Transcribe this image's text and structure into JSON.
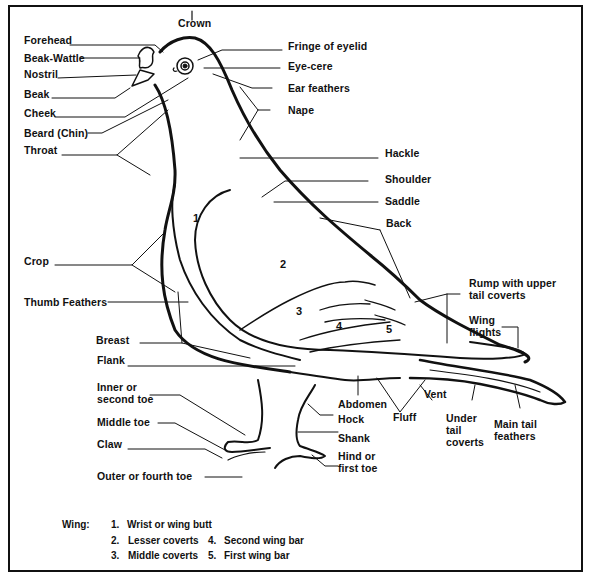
{
  "diagram": {
    "type": "anatomy",
    "labels_left": [
      {
        "id": "forehead",
        "text": "Forehead"
      },
      {
        "id": "beak-wattle",
        "text": "Beak-Wattle"
      },
      {
        "id": "nostril",
        "text": "Nostril"
      },
      {
        "id": "beak",
        "text": "Beak"
      },
      {
        "id": "cheek",
        "text": "Cheek"
      },
      {
        "id": "beard",
        "text": "Beard (Chin)"
      },
      {
        "id": "throat",
        "text": "Throat"
      },
      {
        "id": "crop",
        "text": "Crop"
      },
      {
        "id": "thumb-feathers",
        "text": "Thumb Feathers"
      },
      {
        "id": "breast",
        "text": "Breast"
      },
      {
        "id": "flank",
        "text": "Flank"
      },
      {
        "id": "inner-toe",
        "text": "Inner or\nsecond toe"
      },
      {
        "id": "middle-toe",
        "text": "Middle toe"
      },
      {
        "id": "claw",
        "text": "Claw"
      },
      {
        "id": "outer-toe",
        "text": "Outer or fourth toe"
      }
    ],
    "labels_top": [
      {
        "id": "crown",
        "text": "Crown"
      }
    ],
    "labels_right": [
      {
        "id": "fringe-of-eyelid",
        "text": "Fringe of eyelid"
      },
      {
        "id": "eye-cere",
        "text": "Eye-cere"
      },
      {
        "id": "ear-feathers",
        "text": "Ear feathers"
      },
      {
        "id": "nape",
        "text": "Nape"
      },
      {
        "id": "hackle",
        "text": "Hackle"
      },
      {
        "id": "shoulder",
        "text": "Shoulder"
      },
      {
        "id": "saddle",
        "text": "Saddle"
      },
      {
        "id": "back",
        "text": "Back"
      },
      {
        "id": "rump",
        "text": "Rump with upper\ntail coverts"
      },
      {
        "id": "wing-flights",
        "text": "Wing\nflights"
      }
    ],
    "labels_bottom": [
      {
        "id": "abdomen",
        "text": "Abdomen"
      },
      {
        "id": "hock",
        "text": "Hock"
      },
      {
        "id": "shank",
        "text": "Shank"
      },
      {
        "id": "hind-toe",
        "text": "Hind or\nfirst toe"
      },
      {
        "id": "fluff",
        "text": "Fluff"
      },
      {
        "id": "vent",
        "text": "Vent"
      },
      {
        "id": "under-tail-coverts",
        "text": "Under\ntail\ncoverts"
      },
      {
        "id": "main-tail-feathers",
        "text": "Main tail\nfeathers"
      }
    ],
    "wing_numbers": [
      "1",
      "2",
      "3",
      "4",
      "5"
    ],
    "legend": {
      "title": "Wing:",
      "items": [
        {
          "num": "1.",
          "text": "Wrist or wing butt"
        },
        {
          "num": "2.",
          "text": "Lesser coverts"
        },
        {
          "num": "3.",
          "text": "Middle coverts"
        },
        {
          "num": "4.",
          "text": "Second wing bar"
        },
        {
          "num": "5.",
          "text": "First wing bar"
        }
      ]
    },
    "colors": {
      "ink": "#111111",
      "background": "#ffffff"
    }
  }
}
